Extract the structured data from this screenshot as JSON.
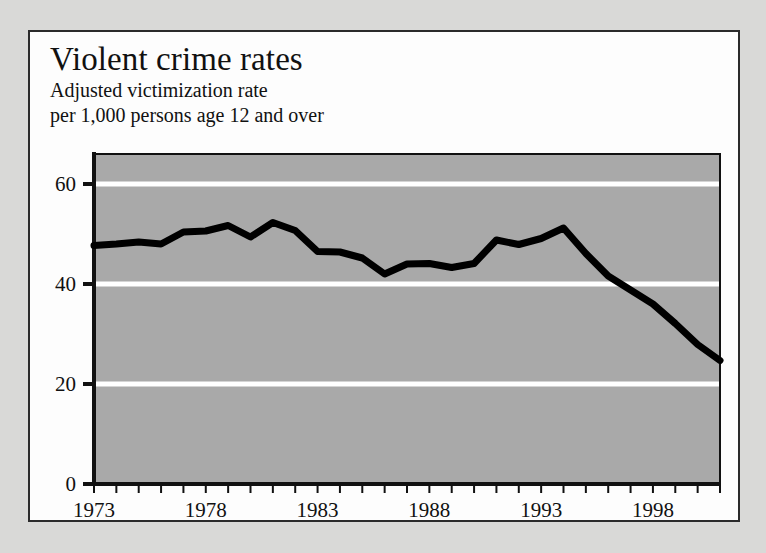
{
  "chart_data": {
    "type": "line",
    "title": "Violent crime rates",
    "subtitle_lines": [
      "Adjusted victimization rate",
      "per 1,000 persons age 12 and over"
    ],
    "xlabel": "",
    "ylabel": "",
    "xlim": [
      1973,
      2001
    ],
    "ylim": [
      0,
      66
    ],
    "grid": true,
    "gridlines_y": [
      20,
      40,
      60
    ],
    "legend": null,
    "yticks": [
      0,
      20,
      40,
      60
    ],
    "ytick_labels": [
      "0",
      "20",
      "40",
      "60"
    ],
    "xticks_major": [
      1973,
      1978,
      1983,
      1988,
      1993,
      1998
    ],
    "xtick_labels": [
      "1973",
      "1978",
      "1983",
      "1988",
      "1993",
      "1998"
    ],
    "xticks_minor_every": 1,
    "x": [
      1973,
      1974,
      1975,
      1976,
      1977,
      1978,
      1979,
      1980,
      1981,
      1982,
      1983,
      1984,
      1985,
      1986,
      1987,
      1988,
      1989,
      1990,
      1991,
      1992,
      1993,
      1994,
      1995,
      1996,
      1997,
      1998,
      1999,
      2000,
      2001
    ],
    "values": [
      47.7,
      48.0,
      48.4,
      48.0,
      50.4,
      50.6,
      51.7,
      49.4,
      52.3,
      50.7,
      46.5,
      46.4,
      45.2,
      42.0,
      44.0,
      44.1,
      43.3,
      44.1,
      48.8,
      47.9,
      49.1,
      51.2,
      46.1,
      41.6,
      38.8,
      36.0,
      32.1,
      27.9,
      24.7
    ],
    "series_name": "Adjusted victimization rate",
    "line_color": "#000000",
    "plot_background": "#a9a9a9",
    "gridline_color": "#ffffff",
    "axis_color": "#111111",
    "card_background": "#fdfdfd",
    "page_background": "#d9d9d7"
  }
}
